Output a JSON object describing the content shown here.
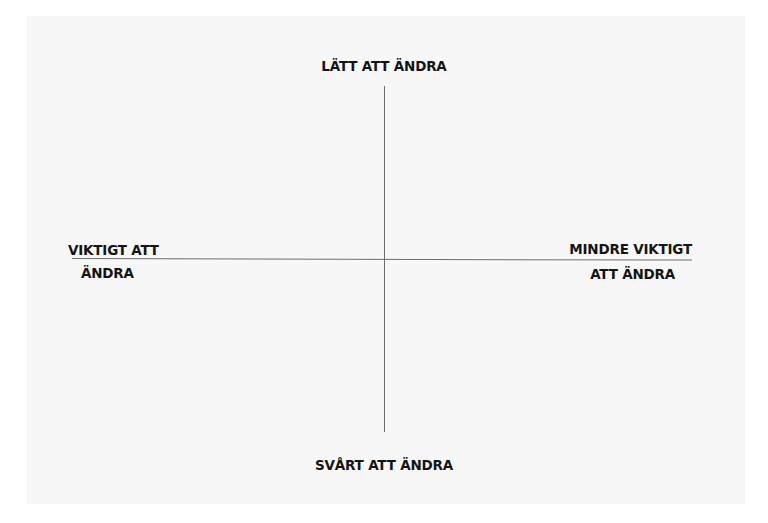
{
  "diagram": {
    "type": "quadrant-matrix",
    "axes": {
      "vertical": {
        "top_label": "LÄTT ATT ÄNDRA",
        "bottom_label": "SVÅRT ATT ÄNDRA"
      },
      "horizontal": {
        "left_label_lines": [
          "VIKTIGT ATT",
          "ÄNDRA"
        ],
        "right_label_lines": [
          "MINDRE VIKTIGT",
          "ATT ÄNDRA"
        ]
      }
    },
    "colors": {
      "background": "#ffffff",
      "panel": "#f7f7f7",
      "axis_line": "#6e6e6e",
      "text": "#141414"
    }
  }
}
